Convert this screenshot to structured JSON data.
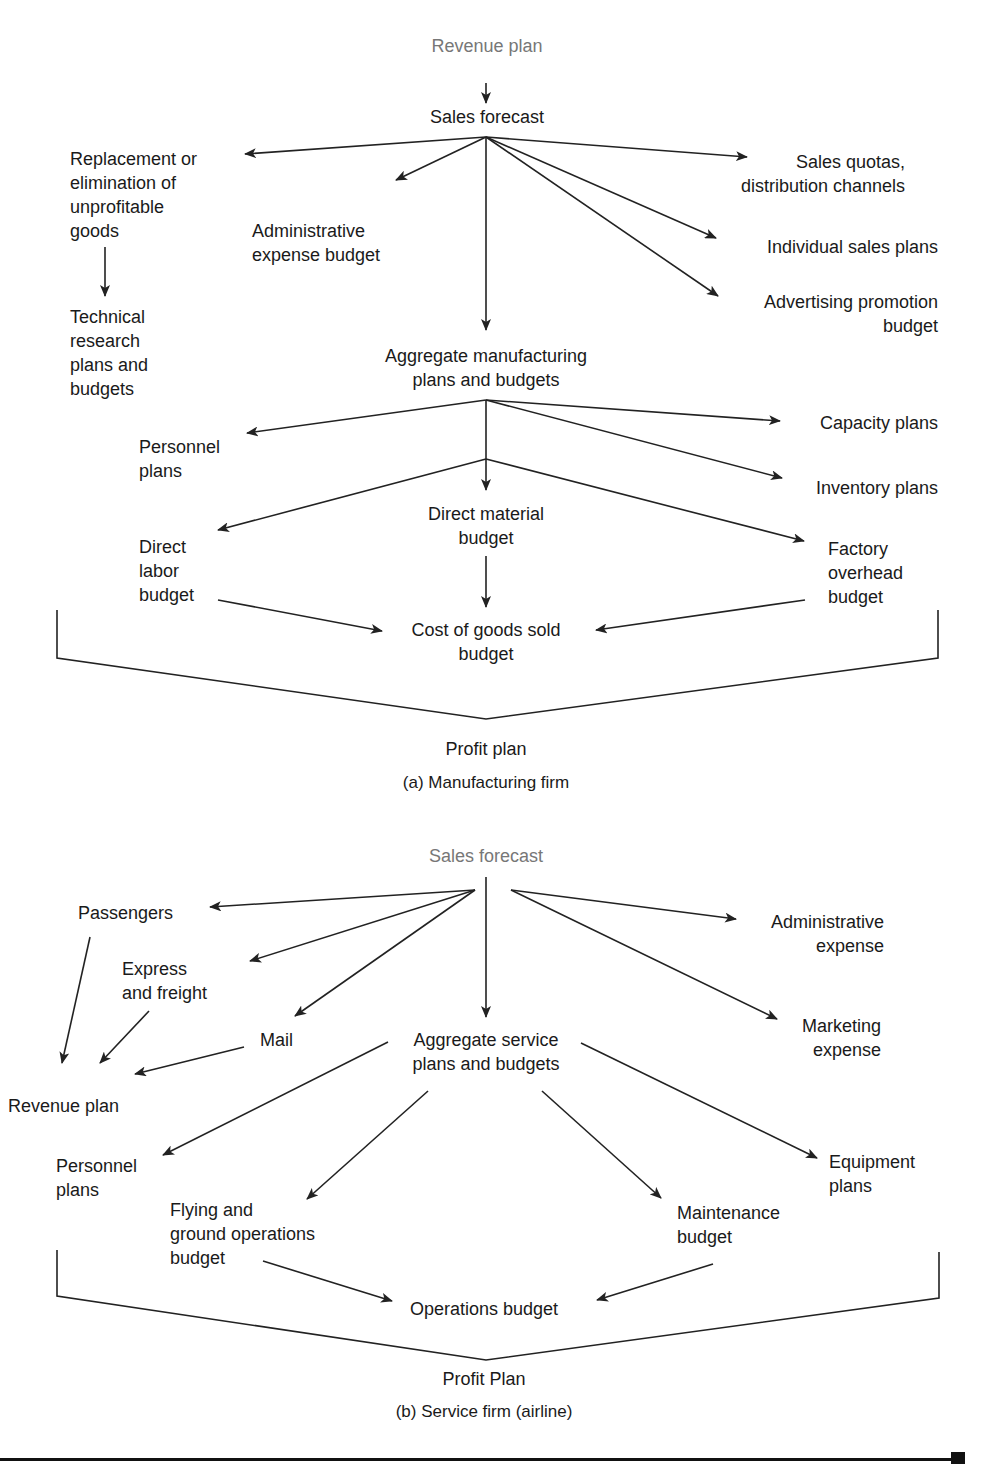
{
  "diagram_a": {
    "caption": "(a) Manufacturing firm",
    "nodes": [
      {
        "id": "revenue_plan",
        "text": "Revenue plan",
        "x": 487,
        "y": 34,
        "align": "c",
        "gray": true
      },
      {
        "id": "sales_forecast",
        "text": "Sales forecast",
        "x": 487,
        "y": 105,
        "align": "c"
      },
      {
        "id": "replacement",
        "text": "Replacement or\nelimination of\nunprofitable\ngoods",
        "x": 70,
        "y": 147,
        "align": "l"
      },
      {
        "id": "technical_research",
        "text": "Technical\nresearch\nplans and\nbudgets",
        "x": 70,
        "y": 305,
        "align": "l"
      },
      {
        "id": "admin_expense_budget",
        "text": "Administrative\nexpense budget",
        "x": 252,
        "y": 219,
        "align": "l"
      },
      {
        "id": "sales_quotas",
        "text": "Sales quotas,\ndistribution channels",
        "x": 905,
        "y": 150,
        "align": "r"
      },
      {
        "id": "individual_sales",
        "text": "Individual sales plans",
        "x": 938,
        "y": 235,
        "align": "r"
      },
      {
        "id": "advertising",
        "text": "Advertising promotion\nbudget",
        "x": 938,
        "y": 290,
        "align": "r"
      },
      {
        "id": "aggregate_mfg",
        "text": "Aggregate manufacturing\nplans and budgets",
        "x": 486,
        "y": 344,
        "align": "c"
      },
      {
        "id": "personnel_plans",
        "text": "Personnel\nplans",
        "x": 139,
        "y": 435,
        "align": "l"
      },
      {
        "id": "capacity_plans",
        "text": "Capacity plans",
        "x": 938,
        "y": 411,
        "align": "r"
      },
      {
        "id": "inventory_plans",
        "text": "Inventory plans",
        "x": 938,
        "y": 476,
        "align": "r"
      },
      {
        "id": "direct_material",
        "text": "Direct material\nbudget",
        "x": 486,
        "y": 502,
        "align": "c"
      },
      {
        "id": "direct_labor",
        "text": "Direct\nlabor\nbudget",
        "x": 139,
        "y": 535,
        "align": "l"
      },
      {
        "id": "factory_overhead",
        "text": "Factory\noverhead\nbudget",
        "x": 828,
        "y": 537,
        "align": "l"
      },
      {
        "id": "cogs",
        "text": "Cost of goods sold\nbudget",
        "x": 486,
        "y": 618,
        "align": "c"
      },
      {
        "id": "profit_plan",
        "text": "Profit plan",
        "x": 486,
        "y": 737,
        "align": "c"
      }
    ],
    "caption_pos": {
      "x": 486,
      "y": 771
    }
  },
  "diagram_b": {
    "caption": "(b) Service firm (airline)",
    "nodes": [
      {
        "id": "sales_forecast",
        "text": "Sales forecast",
        "x": 486,
        "y": 844,
        "align": "c",
        "gray": true
      },
      {
        "id": "passengers",
        "text": "Passengers",
        "x": 78,
        "y": 901,
        "align": "l"
      },
      {
        "id": "express_freight",
        "text": "Express\nand freight",
        "x": 122,
        "y": 957,
        "align": "l"
      },
      {
        "id": "mail",
        "text": "Mail",
        "x": 260,
        "y": 1028,
        "align": "l"
      },
      {
        "id": "revenue_plan",
        "text": "Revenue plan",
        "x": 8,
        "y": 1094,
        "align": "l"
      },
      {
        "id": "admin_expense",
        "text": "Administrative\nexpense",
        "x": 884,
        "y": 910,
        "align": "r"
      },
      {
        "id": "marketing_expense",
        "text": "Marketing\nexpense",
        "x": 881,
        "y": 1014,
        "align": "r"
      },
      {
        "id": "aggregate_service",
        "text": "Aggregate service\nplans and budgets",
        "x": 486,
        "y": 1028,
        "align": "c"
      },
      {
        "id": "personnel_plans",
        "text": "Personnel\nplans",
        "x": 56,
        "y": 1154,
        "align": "l"
      },
      {
        "id": "flying_ground",
        "text": "Flying and\nground operations\nbudget",
        "x": 170,
        "y": 1198,
        "align": "l"
      },
      {
        "id": "maintenance_budget",
        "text": "Maintenance\nbudget",
        "x": 677,
        "y": 1201,
        "align": "l"
      },
      {
        "id": "equipment_plans",
        "text": "Equipment\nplans",
        "x": 829,
        "y": 1150,
        "align": "l"
      },
      {
        "id": "operations_budget",
        "text": "Operations budget",
        "x": 484,
        "y": 1297,
        "align": "c"
      },
      {
        "id": "profit_plan",
        "text": "Profit Plan",
        "x": 484,
        "y": 1367,
        "align": "c"
      }
    ],
    "caption_pos": {
      "x": 484,
      "y": 1400
    }
  },
  "arrows_a": [
    [
      486,
      83,
      486,
      103
    ],
    [
      486,
      137,
      245,
      154
    ],
    [
      486,
      137,
      396,
      180
    ],
    [
      486,
      137,
      486,
      330
    ],
    [
      486,
      137,
      747,
      157
    ],
    [
      486,
      137,
      716,
      238
    ],
    [
      486,
      137,
      718,
      296
    ],
    [
      105,
      247,
      105,
      296
    ],
    [
      486,
      400,
      247,
      433
    ],
    [
      486,
      400,
      780,
      421
    ],
    [
      486,
      400,
      782,
      478
    ],
    [
      486,
      400,
      486,
      490
    ],
    [
      486,
      459,
      218,
      530
    ],
    [
      486,
      459,
      804,
      541
    ],
    [
      486,
      556,
      486,
      607
    ],
    [
      218,
      600,
      382,
      631
    ],
    [
      805,
      600,
      596,
      630
    ]
  ],
  "lines_a": [
    [
      57,
      610,
      57,
      658,
      486,
      719,
      938,
      658,
      938,
      610
    ]
  ],
  "arrows_b": [
    [
      486,
      877,
      486,
      1017
    ],
    [
      475,
      890,
      210,
      907
    ],
    [
      475,
      890,
      250,
      961
    ],
    [
      475,
      890,
      295,
      1016
    ],
    [
      511,
      890,
      736,
      919
    ],
    [
      511,
      890,
      777,
      1019
    ],
    [
      90,
      937,
      62,
      1063
    ],
    [
      149,
      1011,
      100,
      1063
    ],
    [
      244,
      1047,
      135,
      1074
    ],
    [
      388,
      1042,
      163,
      1155
    ],
    [
      428,
      1091,
      307,
      1199
    ],
    [
      542,
      1091,
      661,
      1198
    ],
    [
      581,
      1043,
      817,
      1158
    ],
    [
      263,
      1261,
      392,
      1301
    ],
    [
      713,
      1264,
      597,
      1300
    ]
  ],
  "lines_b": [
    [
      57,
      1250,
      57,
      1296,
      486,
      1360,
      939,
      1298,
      939,
      1252
    ]
  ],
  "colors": {
    "ink": "#222222",
    "gray_text": "#777777"
  }
}
